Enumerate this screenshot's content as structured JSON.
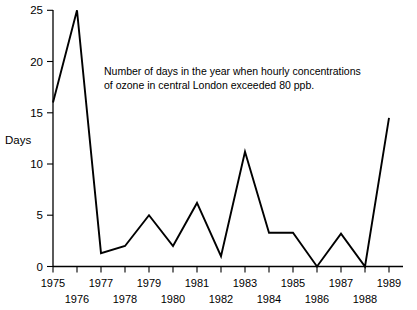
{
  "chart_data": {
    "type": "line",
    "title": "",
    "annotation": [
      "Number of days in the year when hourly concentrations",
      "of ozone in central London exceeded 80 ppb."
    ],
    "xlabel": "",
    "ylabel": "Days",
    "ylim": [
      0,
      25
    ],
    "yticks": [
      0,
      5,
      10,
      15,
      20,
      25
    ],
    "ytick_labels": [
      "0",
      "5",
      "10",
      "15",
      "20",
      "25"
    ],
    "grid": false,
    "legend": "none",
    "line_color": "#000000",
    "categories": [
      "1975",
      "1976",
      "1977",
      "1978",
      "1979",
      "1980",
      "1981",
      "1982",
      "1983",
      "1984",
      "1985",
      "1986",
      "1987",
      "1988",
      "1989"
    ],
    "x": [
      1975,
      1976,
      1977,
      1978,
      1979,
      1980,
      1981,
      1982,
      1983,
      1984,
      1985,
      1986,
      1987,
      1988,
      1989
    ],
    "values": [
      16,
      25,
      1.3,
      2,
      5,
      2,
      6.2,
      1,
      11.2,
      3.3,
      3.3,
      0,
      3.2,
      0,
      14.5
    ],
    "xtick_rows": [
      {
        "row": "top",
        "labels": [
          "1975",
          "1977",
          "1979",
          "1981",
          "1983",
          "1985",
          "1987",
          "1989"
        ]
      },
      {
        "row": "bottom",
        "labels": [
          "1976",
          "1978",
          "1980",
          "1982",
          "1984",
          "1986",
          "1988"
        ]
      }
    ]
  },
  "axis": {
    "y_label": "Days",
    "y_tick_0": "0",
    "y_tick_5": "5",
    "y_tick_10": "10",
    "y_tick_15": "15",
    "y_tick_20": "20",
    "y_tick_25": "25"
  },
  "annotation": {
    "line1": "Number of days in the year when hourly concentrations",
    "line2": "of ozone in central London exceeded 80 ppb."
  },
  "xlabels_top": {
    "y1975": "1975",
    "y1977": "1977",
    "y1979": "1979",
    "y1981": "1981",
    "y1983": "1983",
    "y1985": "1985",
    "y1987": "1987",
    "y1989": "1989"
  },
  "xlabels_bottom": {
    "y1976": "1976",
    "y1978": "1978",
    "y1980": "1980",
    "y1982": "1982",
    "y1984": "1984",
    "y1986": "1986",
    "y1988": "1988"
  }
}
